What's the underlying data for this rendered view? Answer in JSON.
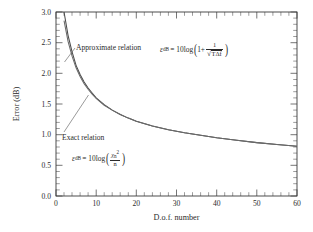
{
  "chart_data": {
    "type": "line",
    "title": "",
    "xlabel": "D.o.f. number",
    "ylabel": "Error (dB)",
    "xlim": [
      0,
      60
    ],
    "ylim": [
      0.0,
      3.0
    ],
    "xticks": [
      "0",
      "10",
      "20",
      "30",
      "40",
      "50",
      "60"
    ],
    "xtick_values": [
      0,
      10,
      20,
      30,
      40,
      50,
      60
    ],
    "yticks": [
      "0.0",
      "0.5",
      "1.0",
      "1.5",
      "2.0",
      "2.5",
      "3.0"
    ],
    "ytick_values": [
      0.0,
      0.5,
      1.0,
      1.5,
      2.0,
      2.5,
      3.0
    ],
    "grid": false,
    "legend_position": "in-plot annotations",
    "minor_ticks": true,
    "x": [
      2,
      3,
      4,
      5,
      6,
      7,
      8,
      9,
      10,
      12,
      14,
      16,
      18,
      20,
      24,
      28,
      32,
      36,
      40,
      45,
      50,
      55,
      60
    ],
    "series": [
      {
        "name": "Approximate relation",
        "values": [
          3.0,
          2.62,
          2.35,
          2.13,
          1.98,
          1.86,
          1.76,
          1.68,
          1.6,
          1.49,
          1.4,
          1.33,
          1.27,
          1.22,
          1.14,
          1.08,
          1.03,
          0.99,
          0.95,
          0.91,
          0.87,
          0.84,
          0.81
        ]
      },
      {
        "name": "Exact relation",
        "values": [
          2.86,
          2.52,
          2.28,
          2.09,
          1.95,
          1.83,
          1.74,
          1.66,
          1.59,
          1.48,
          1.4,
          1.33,
          1.27,
          1.22,
          1.14,
          1.08,
          1.03,
          0.99,
          0.95,
          0.91,
          0.87,
          0.84,
          0.81
        ]
      }
    ],
    "annotations": [
      {
        "label": "Approximate relation",
        "formula_plain": "e_dB = 10 log(1 + 1/sqrt(T df))"
      },
      {
        "label": "Exact relation",
        "formula_plain": "e_dB = 10 log(chi_n^2 / n)"
      }
    ]
  },
  "labels": {
    "approx_relation": "Approximate relation",
    "exact_relation": "Exact relation",
    "xaxis_title": "D.o.f. number",
    "yaxis_title": "Error (dB)"
  },
  "formula_approx": {
    "eps": "ε",
    "eps_sub": "dB",
    "equals": "= 10log",
    "one_plus": "1+",
    "numerator": "1",
    "radical": "√",
    "radicand_T": "T",
    "radicand_delta": "Δf"
  },
  "formula_exact": {
    "eps": "ε",
    "eps_sub": "dB",
    "equals": "= 10log",
    "chi": "χ",
    "chi_sub": "n",
    "chi_sup": "2",
    "den": "n"
  },
  "colors": {
    "curve_approx": "#4a4a4a",
    "curve_exact": "#6a6a6a",
    "frame": "#3a3a3a",
    "text": "#2b2b2b",
    "background": "#ffffff"
  }
}
